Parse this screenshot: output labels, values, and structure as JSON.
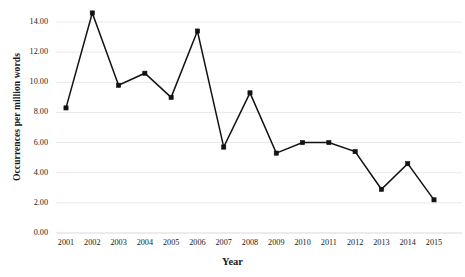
{
  "chart_data": {
    "type": "line",
    "title": "",
    "xlabel": "Year",
    "ylabel": "Occurrences per million words",
    "categories": [
      "2001",
      "2002",
      "2003",
      "2004",
      "2005",
      "2006",
      "2007",
      "2008",
      "2009",
      "2010",
      "2011",
      "2012",
      "2013",
      "2014",
      "2015"
    ],
    "values": [
      8.3,
      14.6,
      9.8,
      10.6,
      9.0,
      13.4,
      5.7,
      9.3,
      5.3,
      6.0,
      6.0,
      5.4,
      2.9,
      4.6,
      2.2
    ],
    "series": [
      {
        "name": "Occurrences per million words",
        "values": [
          8.3,
          14.6,
          9.8,
          10.6,
          9.0,
          13.4,
          5.7,
          9.3,
          5.3,
          6.0,
          6.0,
          5.4,
          2.9,
          4.6,
          2.2
        ]
      }
    ],
    "ylim": [
      0,
      15
    ],
    "ytick_values": [
      0,
      2,
      4,
      6,
      8,
      10,
      12,
      14
    ],
    "ytick_labels": [
      "0.00",
      "2.00",
      "4.00",
      "6.00",
      "8.00",
      "10.00",
      "12.00",
      "14.00"
    ],
    "grid": true,
    "legend": "none",
    "marker": "square",
    "line_color": "#121212",
    "grid_color": "#e9e9e9",
    "background_color": "#ffffff"
  }
}
